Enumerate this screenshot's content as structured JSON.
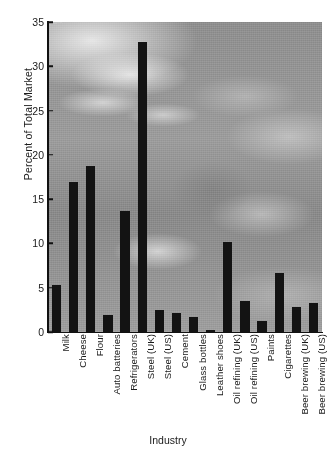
{
  "chart_data": {
    "type": "bar",
    "title": "",
    "xlabel": "Industry",
    "ylabel": "Percent of Total Market",
    "ylim": [
      0,
      35
    ],
    "yticks": [
      0,
      5,
      10,
      15,
      20,
      25,
      30,
      35
    ],
    "grid": false,
    "legend": "none",
    "bar_color": "#131313",
    "background": "grayscale industrial photograph",
    "categories": [
      "Milk",
      "Cheese",
      "Flour",
      "Auto batteries",
      "Refrigerators",
      "Steel (UK)",
      "Steel (US)",
      "Cement",
      "Glass bottles",
      "Leather shoes",
      "Oil refining (UK)",
      "Oil refining (US)",
      "Paints",
      "Cigarettes",
      "Beer brewing (UK)",
      "Beer brewing (US)"
    ],
    "values": [
      5.3,
      16.9,
      18.7,
      1.9,
      13.7,
      32.7,
      2.5,
      2.1,
      1.7,
      0.2,
      10.2,
      3.5,
      1.3,
      6.7,
      2.8,
      3.3
    ]
  }
}
